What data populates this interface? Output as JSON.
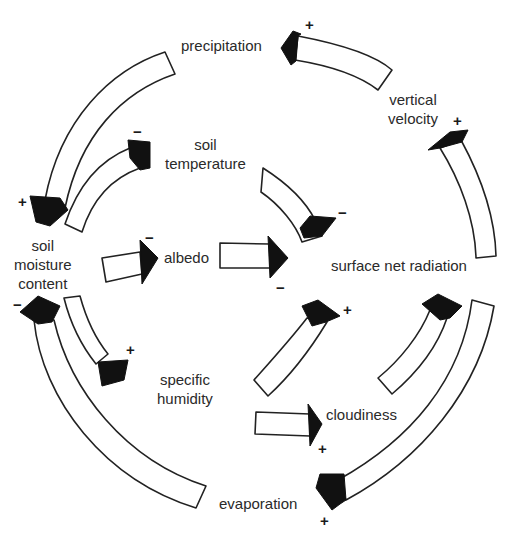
{
  "diagram": {
    "type": "feedback-loop",
    "nodes": {
      "precipitation": "precipitation",
      "vertical_velocity_l1": "vertical",
      "vertical_velocity_l2": "velocity",
      "soil_temperature_l1": "soil",
      "soil_temperature_l2": "temperature",
      "soil_moisture_l1": "soil",
      "soil_moisture_l2": "moisture",
      "soil_moisture_l3": "content",
      "albedo": "albedo",
      "surface_net_radiation": "surface net radiation",
      "specific_humidity_l1": "specific",
      "specific_humidity_l2": "humidity",
      "cloudiness": "cloudiness",
      "evaporation": "evaporation"
    },
    "signs": {
      "vv_to_precip": "+",
      "snr_to_vv": "+",
      "precip_to_sm": "+",
      "sm_to_st": "−",
      "st_to_snr": "−",
      "sm_to_albedo": "−",
      "albedo_to_snr": "−",
      "evap_to_sm": "−",
      "sm_to_sh": "+",
      "sh_to_snr": "+",
      "sh_to_cloud": "+",
      "cloud_to_snr": "+",
      "snr_to_evap": "+"
    },
    "edges": [
      {
        "from": "vertical velocity",
        "to": "precipitation",
        "sign": "+"
      },
      {
        "from": "surface net radiation",
        "to": "vertical velocity",
        "sign": "+"
      },
      {
        "from": "precipitation",
        "to": "soil moisture content",
        "sign": "+"
      },
      {
        "from": "soil moisture content",
        "to": "soil temperature",
        "sign": "−"
      },
      {
        "from": "soil temperature",
        "to": "surface net radiation",
        "sign": "−"
      },
      {
        "from": "soil moisture content",
        "to": "albedo",
        "sign": "−"
      },
      {
        "from": "albedo",
        "to": "surface net radiation",
        "sign": "−"
      },
      {
        "from": "evaporation",
        "to": "soil moisture content",
        "sign": "−"
      },
      {
        "from": "soil moisture content",
        "to": "specific humidity",
        "sign": "+"
      },
      {
        "from": "specific humidity",
        "to": "surface net radiation",
        "sign": "+"
      },
      {
        "from": "specific humidity",
        "to": "cloudiness",
        "sign": "+"
      },
      {
        "from": "cloudiness",
        "to": "surface net radiation",
        "sign": "+"
      },
      {
        "from": "surface net radiation",
        "to": "evaporation",
        "sign": "+"
      }
    ]
  }
}
